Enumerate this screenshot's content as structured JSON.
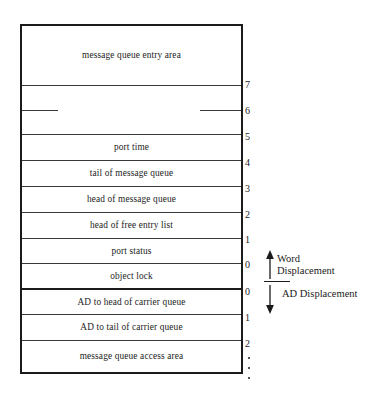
{
  "diagram": {
    "structure": {
      "rows": [
        {
          "label": "message queue entry area",
          "offset": "",
          "tall": true
        },
        {
          "label": "",
          "offset": "7"
        },
        {
          "label": "",
          "offset": "6"
        },
        {
          "label": "port time",
          "offset": "5"
        },
        {
          "label": "tail of message queue",
          "offset": "4"
        },
        {
          "label": "head of message queue",
          "offset": "3"
        },
        {
          "label": "head of free entry list",
          "offset": "2"
        },
        {
          "label": "port status",
          "offset": "1"
        },
        {
          "label": "object lock",
          "offset": "0"
        },
        {
          "label": "AD to head of carrier queue",
          "offset": "0"
        },
        {
          "label": "AD to tail of carrier queue",
          "offset": "1"
        },
        {
          "label": "message queue access area",
          "offset": "2"
        }
      ]
    },
    "offsets": {
      "word_region": [
        "7",
        "6",
        "5",
        "4",
        "3",
        "2",
        "1",
        "0"
      ],
      "ad_region": [
        "0",
        "1",
        "2"
      ],
      "continuation_dots": 3
    },
    "annotations": [
      {
        "id": "word",
        "line1": "Word",
        "line2": "Displacement",
        "arrow": "up-arrow-icon"
      },
      {
        "id": "ad",
        "line1": "AD Displacement",
        "line2": "",
        "arrow": "down-arrow-icon"
      }
    ],
    "colors": {
      "ink": "#1b1b1b",
      "rule": "#3a3a3a",
      "background": "#ffffff"
    }
  }
}
